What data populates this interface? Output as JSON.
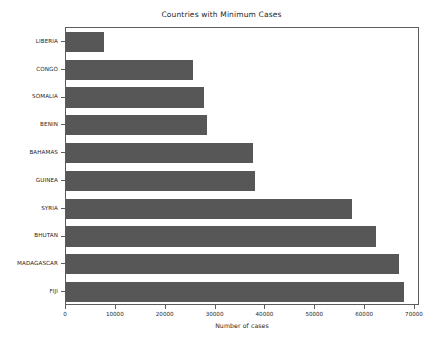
{
  "chart_data": {
    "type": "bar",
    "orientation": "horizontal",
    "title": "Countries with Minimum Cases",
    "xlabel": "Number of cases",
    "ylabel": "",
    "categories": [
      "LIBERIA",
      "CONGO",
      "SOMALIA",
      "BENIN",
      "BAHAMAS",
      "GUINEA",
      "SYRIA",
      "BHUTAN",
      "MADAGASCAR",
      "FIJI"
    ],
    "values": [
      7600,
      25400,
      27600,
      28200,
      37600,
      38000,
      57400,
      62200,
      66800,
      67800
    ],
    "xticks": [
      0,
      10000,
      20000,
      30000,
      40000,
      50000,
      60000,
      70000
    ],
    "xtick_labels": [
      "0",
      "10000",
      "20000",
      "30000",
      "40000",
      "50000",
      "60000",
      "70000"
    ],
    "xlim": [
      0,
      71000
    ],
    "grid": false,
    "legend": false,
    "bar_color": "#575757",
    "background_color": "#ffffff",
    "axis_color": "#5c5c5c",
    "text_color": "#262626"
  }
}
